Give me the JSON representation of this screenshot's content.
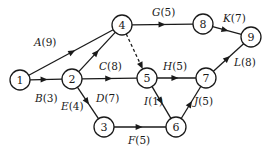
{
  "diagram": {
    "type": "activity-network",
    "nodes": [
      {
        "id": "1",
        "label": "1",
        "x": 20,
        "y": 80
      },
      {
        "id": "2",
        "label": "2",
        "x": 72,
        "y": 79
      },
      {
        "id": "3",
        "label": "3",
        "x": 104,
        "y": 127
      },
      {
        "id": "4",
        "label": "4",
        "x": 122,
        "y": 25
      },
      {
        "id": "5",
        "label": "5",
        "x": 147,
        "y": 78
      },
      {
        "id": "6",
        "label": "6",
        "x": 176,
        "y": 127
      },
      {
        "id": "7",
        "label": "7",
        "x": 206,
        "y": 78
      },
      {
        "id": "8",
        "label": "8",
        "x": 203,
        "y": 24
      },
      {
        "id": "9",
        "label": "9",
        "x": 251,
        "y": 37
      }
    ],
    "edges": [
      {
        "name": "A",
        "duration": "(9)",
        "from": "1",
        "to": "4",
        "lx": 34,
        "ly": 46
      },
      {
        "name": "B",
        "duration": "(3)",
        "from": "1",
        "to": "2",
        "lx": 35,
        "ly": 102
      },
      {
        "name": "C",
        "duration": "(8)",
        "from": "2",
        "to": "4",
        "lx": 99,
        "ly": 70
      },
      {
        "name": "D",
        "duration": "(7)",
        "from": "2",
        "to": "5",
        "lx": 96,
        "ly": 102
      },
      {
        "name": "E",
        "duration": "(4)",
        "from": "2",
        "to": "3",
        "lx": 61,
        "ly": 110
      },
      {
        "name": "F",
        "duration": "(5)",
        "from": "3",
        "to": "6",
        "lx": 128,
        "ly": 144
      },
      {
        "name": "G",
        "duration": "(5)",
        "from": "4",
        "to": "8",
        "lx": 152,
        "ly": 16
      },
      {
        "name": "H",
        "duration": "(5)",
        "from": "5",
        "to": "7",
        "lx": 163,
        "ly": 70
      },
      {
        "name": "I",
        "duration": "(1)",
        "from": "5",
        "to": "6",
        "lx": 144,
        "ly": 105
      },
      {
        "name": "J",
        "duration": "(5)",
        "from": "6",
        "to": "7",
        "lx": 194,
        "ly": 105
      },
      {
        "name": "K",
        "duration": "(7)",
        "from": "8",
        "to": "9",
        "lx": 223,
        "ly": 22
      },
      {
        "name": "L",
        "duration": "(8)",
        "from": "7",
        "to": "9",
        "lx": 234,
        "ly": 66
      },
      {
        "name": "",
        "duration": "",
        "from": "4",
        "to": "5",
        "dashed": true
      }
    ]
  }
}
